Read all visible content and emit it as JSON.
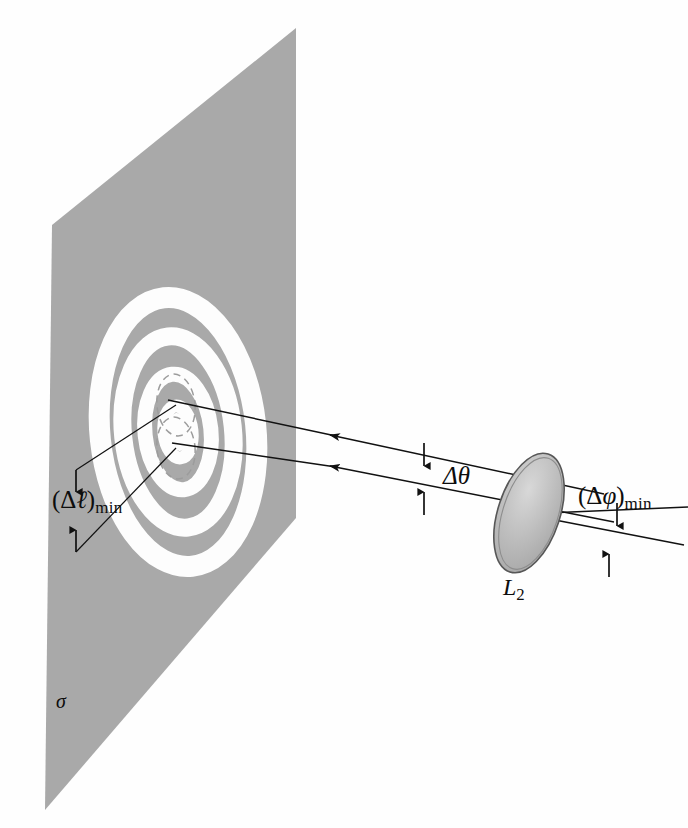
{
  "figure": {
    "domain": "diagram",
    "background_color": "#fefefe",
    "ink_color": "#111111"
  },
  "screen_plane": {
    "name": "sigma",
    "label": "σ",
    "fill_color": "#a9a9a9",
    "corners": [
      [
        52,
        225
      ],
      [
        296,
        28
      ],
      [
        296,
        518
      ],
      [
        45,
        810
      ]
    ]
  },
  "diffraction_pattern": {
    "description": "concentric elliptical Airy rings, white maxima on gray field",
    "ring_color": "#fdfdfd",
    "field_color": "#a9a9a9",
    "center": [
      178,
      432
    ],
    "rings": [
      {
        "rx": 78,
        "ry": 135,
        "stroke_width": 21
      },
      {
        "rx": 55,
        "ry": 96,
        "stroke_width": 18
      },
      {
        "rx": 33,
        "ry": 58,
        "stroke_width": 15
      },
      {
        "rx": 14,
        "ry": 26,
        "stroke_width": 11
      }
    ],
    "airy_disks": [
      {
        "label": "disk-1",
        "cx": 176,
        "cy": 405,
        "rx": 19,
        "ry": 31,
        "dashed": true
      },
      {
        "label": "disk-2",
        "cx": 176,
        "cy": 448,
        "rx": 19,
        "ry": 31,
        "dashed": true
      }
    ]
  },
  "lens": {
    "label": "L",
    "subscript": "2",
    "fill_color": "#b9b9b9",
    "rim_color": "#5b5b5b",
    "center": [
      529,
      513
    ],
    "rx": 31,
    "ry": 62,
    "rotation_deg": 18
  },
  "rays": [
    {
      "name": "upper-ray",
      "from": [
        604,
        494
      ],
      "to": [
        168,
        400
      ]
    },
    {
      "name": "lower-ray",
      "from": [
        614,
        522
      ],
      "to": [
        172,
        443
      ]
    },
    {
      "name": "object-ray-upper",
      "from": [
        681,
        508
      ],
      "to": [
        529,
        513
      ]
    },
    {
      "name": "object-ray-lower",
      "from": [
        676,
        542
      ],
      "to": [
        529,
        513
      ]
    },
    {
      "name": "spread-ray-upper",
      "from": [
        60,
        475
      ],
      "to": [
        176,
        405
      ]
    },
    {
      "name": "spread-ray-lower",
      "from": [
        62,
        550
      ],
      "to": [
        176,
        448
      ]
    }
  ],
  "labels": {
    "image_separation": {
      "text_prefix": "(Δ",
      "symbol": "ℓ",
      "text_suffix": ")",
      "subscript": "min",
      "full": "(Δℓ)min",
      "meaning": "minimum resolvable separation on screen"
    },
    "angular_image": {
      "symbol": "Δθ",
      "full": "Δθ",
      "meaning": "angular separation of image rays at lens"
    },
    "angular_object": {
      "text_prefix": "(Δ",
      "symbol": "φ",
      "text_suffix": ")",
      "subscript": "min",
      "full": "(Δφ)min",
      "meaning": "minimum resolvable angular separation of objects"
    },
    "lens_label": {
      "symbol": "L",
      "subscript": "2",
      "full": "L2"
    },
    "screen_label": {
      "symbol": "σ",
      "full": "σ"
    }
  },
  "dimension_arrows": [
    {
      "name": "dl-arrow-top",
      "x": 76,
      "y1": 472,
      "y2": 492,
      "direction": "down"
    },
    {
      "name": "dl-arrow-bottom",
      "x": 76,
      "y1": 548,
      "y2": 528,
      "direction": "up"
    },
    {
      "name": "dtheta-arrow-top",
      "x": 424,
      "y1": 447,
      "y2": 468,
      "direction": "down"
    },
    {
      "name": "dtheta-arrow-bottom",
      "x": 424,
      "y1": 512,
      "y2": 492,
      "direction": "up"
    },
    {
      "name": "dphi-arrow-top",
      "x": 617,
      "y1": 506,
      "y2": 527,
      "direction": "down"
    },
    {
      "name": "dphi-arrow-bottom",
      "x": 610,
      "y1": 574,
      "y2": 553,
      "direction": "up"
    }
  ]
}
